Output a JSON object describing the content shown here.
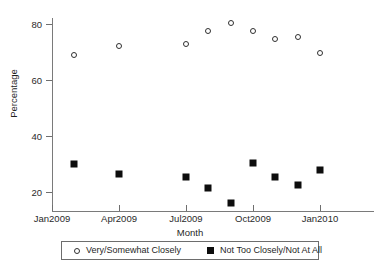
{
  "chart_data": {
    "type": "scatter",
    "title": "",
    "xlabel": "Month",
    "ylabel": "Percentage",
    "ylim": [
      14,
      84
    ],
    "xlim": [
      "Jan2009",
      "Feb2010"
    ],
    "grid": false,
    "legend_position": "bottom",
    "y_ticks": [
      20,
      40,
      60,
      80
    ],
    "y_tick_labels": [
      "20",
      "40",
      "60",
      "80"
    ],
    "x_ticks": [
      "Jan2009",
      "Apr2009",
      "Jul2009",
      "Oct2009",
      "Jan2010"
    ],
    "x": [
      "Feb2009",
      "Apr2009",
      "Jul2009",
      "Aug2009",
      "Sep2009",
      "Oct2009",
      "Nov2009",
      "Dec2009",
      "Jan2010"
    ],
    "series": [
      {
        "name": "Very/Somewhat Closely",
        "marker": "open-circle",
        "color": "#303030",
        "values": [
          69,
          72,
          73,
          77.5,
          80.5,
          77.5,
          74.5,
          75.5,
          69.5
        ]
      },
      {
        "name": "Not Too Closely/Not At All",
        "marker": "filled-square",
        "color": "#0d0d0d",
        "values": [
          30,
          26.5,
          25.5,
          21.5,
          16,
          30.5,
          25.5,
          22.5,
          28
        ]
      }
    ]
  },
  "axis": {
    "y_title": "Percentage",
    "x_title": "Month",
    "y_tick_labels": [
      "80",
      "60",
      "40",
      "20"
    ],
    "x_tick_labels": [
      "Jan2009",
      "Apr2009",
      "Jul2009",
      "Oct2009",
      "Jan2010"
    ]
  },
  "legend": {
    "entries": [
      {
        "label": "Very/Somewhat Closely",
        "marker": "open-circle"
      },
      {
        "label": "Not Too Closely/Not At All",
        "marker": "filled-square"
      }
    ]
  }
}
